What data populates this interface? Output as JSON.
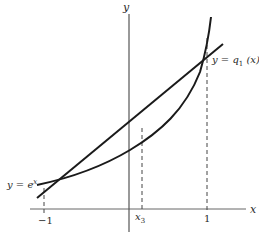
{
  "diagram": {
    "axes": {
      "x_label": "x",
      "y_label": "y"
    },
    "ticks": {
      "minus_one": "−1",
      "x3": "x",
      "x3_sub": "3",
      "one": "1"
    },
    "curves": {
      "exp_label_prefix": "y = e",
      "exp_label_sup": "x",
      "line_label_prefix": "y = q",
      "line_label_sub": "1",
      "line_label_suffix": " (x)"
    },
    "colors": {
      "stroke": "#1a1a1a",
      "axis": "#555555",
      "dashed": "#444444"
    }
  }
}
